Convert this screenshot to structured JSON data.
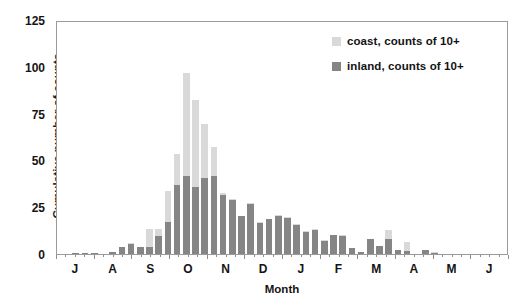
{
  "chart_data": {
    "type": "bar",
    "subtype": "stacked-bar",
    "title": "",
    "xlabel": "Month",
    "ylabel": "Cumulative number of counts",
    "ylim": [
      0,
      125
    ],
    "yticks": [
      0,
      25,
      50,
      75,
      100,
      125
    ],
    "grid": false,
    "legend_position": "top-right",
    "x_tick_labels": [
      "J",
      "A",
      "S",
      "O",
      "N",
      "D",
      "J",
      "F",
      "M",
      "A",
      "M",
      "J"
    ],
    "x_tick_months": [
      "July",
      "August",
      "September",
      "October",
      "November",
      "December",
      "January",
      "February",
      "March",
      "April",
      "May",
      "June"
    ],
    "x_axis_note": "Bars are weekly bins; month initials mark the start of each month.",
    "n_bars": 48,
    "series": [
      {
        "name": "inland, counts of 10+",
        "color": "#858585",
        "values": [
          0,
          0.8,
          0.6,
          0.5,
          0,
          1,
          4,
          5.5,
          4,
          4,
          9.5,
          17.5,
          37,
          42,
          36,
          41,
          42,
          32,
          29,
          20.5,
          27,
          16.5,
          19,
          20.5,
          19.5,
          15.5,
          12,
          13,
          7,
          10,
          9.5,
          3,
          1,
          8,
          4.5,
          8,
          2,
          1.5,
          0,
          2,
          0.8,
          0,
          0,
          0,
          0,
          0,
          0,
          0
        ]
      },
      {
        "name": "coast, counts of 10+",
        "color": "#d9d9d9",
        "values": [
          0,
          0,
          0,
          0,
          0,
          0,
          0,
          0.5,
          0,
          9.5,
          4,
          16.5,
          17,
          55.5,
          47,
          29,
          15.5,
          1,
          0.5,
          0,
          0.5,
          0.5,
          0,
          0.5,
          0.5,
          0.5,
          0.5,
          0.5,
          0.5,
          0.5,
          0.5,
          0.5,
          0,
          0,
          0,
          5,
          0,
          5,
          0,
          0,
          0.5,
          0,
          0,
          0,
          0,
          0,
          0,
          0
        ]
      }
    ],
    "totals": [
      0,
      0.8,
      0.6,
      0.5,
      0,
      1,
      4,
      6,
      4,
      13.5,
      13.5,
      34,
      54,
      97.5,
      83,
      70,
      57.5,
      33,
      29.5,
      20.5,
      27.5,
      17,
      19,
      21,
      20,
      16,
      12.5,
      13.5,
      7.5,
      10.5,
      10,
      3.5,
      1,
      8,
      4.5,
      13,
      2,
      6.5,
      0,
      2,
      1.3,
      0,
      0,
      0,
      0,
      0,
      0,
      0
    ],
    "peak_value": 97.5,
    "peak_category": "October"
  },
  "legend": {
    "items": [
      {
        "label": "coast, counts of 10+",
        "color": "#d9d9d9",
        "swatch_class": "coast"
      },
      {
        "label": "inland, counts of 10+",
        "color": "#858585",
        "swatch_class": "inland"
      }
    ]
  },
  "axes": {
    "y_title": "Cumulative number of counts",
    "x_title": "Month",
    "y_tick_labels": [
      "125",
      "100",
      "75",
      "50",
      "25",
      "0"
    ],
    "x_tick_labels": [
      "J",
      "A",
      "S",
      "O",
      "N",
      "D",
      "J",
      "F",
      "M",
      "A",
      "M",
      "J"
    ]
  },
  "colors": {
    "coast": "#d9d9d9",
    "inland": "#858585",
    "axis": "#9a9a9a",
    "text": "#151515",
    "background": "#ffffff"
  }
}
